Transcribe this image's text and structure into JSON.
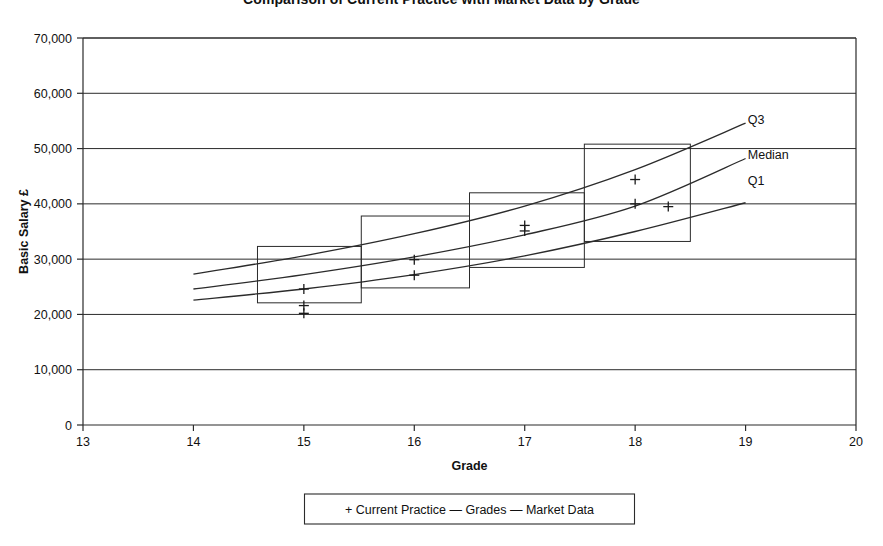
{
  "chart_data": {
    "type": "line",
    "title": "Comparison of Current Practice with Market Data by Grade",
    "xlabel": "Grade",
    "ylabel": "Basic Salary £",
    "xlim": [
      13,
      20
    ],
    "ylim": [
      0,
      70000
    ],
    "x_ticks": [
      13,
      14,
      15,
      16,
      17,
      18,
      19,
      20
    ],
    "x_tick_labels": [
      "13",
      "14",
      "15",
      "16",
      "17",
      "18",
      "19",
      "20"
    ],
    "y_ticks": [
      0,
      10000,
      20000,
      30000,
      40000,
      50000,
      60000,
      70000
    ],
    "y_tick_labels": [
      "0",
      "10,000",
      "20,000",
      "30,000",
      "40,000",
      "50,000",
      "60,000",
      "70,000"
    ],
    "grid": "horizontal",
    "legend_position": "below-center",
    "legend_entries": [
      {
        "marker": "+",
        "label": "Current Practice"
      },
      {
        "marker": "—",
        "label": "Grades"
      },
      {
        "marker": "—",
        "label": "Market Data"
      }
    ],
    "series": [
      {
        "name": "Q3",
        "label": "Q3",
        "kind": "market-curve",
        "label_x": 19.02,
        "label_y": 55200,
        "points": [
          {
            "x": 14.0,
            "y": 27300
          },
          {
            "x": 15.0,
            "y": 30600
          },
          {
            "x": 16.0,
            "y": 34600
          },
          {
            "x": 17.0,
            "y": 39600
          },
          {
            "x": 18.0,
            "y": 46200
          },
          {
            "x": 19.0,
            "y": 54600
          }
        ]
      },
      {
        "name": "Median",
        "label": "Median",
        "kind": "market-curve",
        "label_x": 19.02,
        "label_y": 48900,
        "points": [
          {
            "x": 14.0,
            "y": 24600
          },
          {
            "x": 15.0,
            "y": 27200
          },
          {
            "x": 16.0,
            "y": 30400
          },
          {
            "x": 17.0,
            "y": 34400
          },
          {
            "x": 18.0,
            "y": 39600
          },
          {
            "x": 19.0,
            "y": 48200
          }
        ]
      },
      {
        "name": "Q1",
        "label": "Q1",
        "kind": "market-curve",
        "label_x": 19.02,
        "label_y": 44100,
        "points": [
          {
            "x": 14.0,
            "y": 22600
          },
          {
            "x": 15.0,
            "y": 24600
          },
          {
            "x": 16.0,
            "y": 27200
          },
          {
            "x": 17.0,
            "y": 30600
          },
          {
            "x": 18.0,
            "y": 35000
          },
          {
            "x": 19.0,
            "y": 40200
          }
        ]
      }
    ],
    "grade_bands": [
      {
        "grade": 15,
        "x_start": 14.58,
        "x_end": 15.52,
        "y_min": 22100,
        "y_max": 32300
      },
      {
        "grade": 16,
        "x_start": 15.52,
        "x_end": 16.5,
        "y_min": 24800,
        "y_max": 37800
      },
      {
        "grade": 17,
        "x_start": 16.5,
        "x_end": 17.54,
        "y_min": 28500,
        "y_max": 42000
      },
      {
        "grade": 18,
        "x_start": 17.54,
        "x_end": 18.5,
        "y_min": 33200,
        "y_max": 50800
      }
    ],
    "current_practice_points": [
      {
        "x": 15.0,
        "y": 24600
      },
      {
        "x": 15.0,
        "y": 21600
      },
      {
        "x": 15.0,
        "y": 20200
      },
      {
        "x": 16.0,
        "y": 29900
      },
      {
        "x": 16.0,
        "y": 27100
      },
      {
        "x": 17.0,
        "y": 36100
      },
      {
        "x": 17.0,
        "y": 35100
      },
      {
        "x": 18.0,
        "y": 44400
      },
      {
        "x": 18.0,
        "y": 40000
      },
      {
        "x": 18.3,
        "y": 39500
      }
    ]
  }
}
